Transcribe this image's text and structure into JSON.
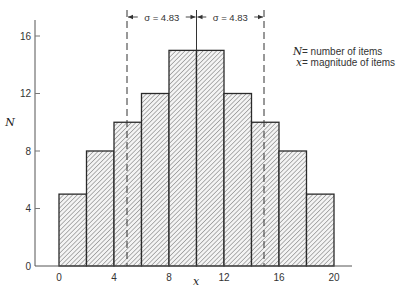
{
  "chart_data": {
    "type": "bar",
    "subtype": "histogram",
    "title": "",
    "xlabel": "x",
    "ylabel": "N",
    "bins": [
      [
        0,
        2
      ],
      [
        2,
        4
      ],
      [
        4,
        6
      ],
      [
        6,
        8
      ],
      [
        8,
        10
      ],
      [
        10,
        12
      ],
      [
        12,
        14
      ],
      [
        14,
        16
      ],
      [
        16,
        18
      ],
      [
        18,
        20
      ]
    ],
    "categories": [
      "0-2",
      "2-4",
      "4-6",
      "6-8",
      "8-10",
      "10-12",
      "12-14",
      "14-16",
      "16-18",
      "18-20"
    ],
    "values": [
      5,
      8,
      10,
      12,
      15,
      15,
      12,
      10,
      8,
      5
    ],
    "xlim": [
      0,
      20
    ],
    "ylim": [
      0,
      17
    ],
    "xticks": [
      0,
      4,
      8,
      12,
      16,
      20
    ],
    "yticks": [
      0,
      4,
      8,
      12,
      16
    ],
    "grid": false,
    "fill_pattern": "diagonal-hatch",
    "mean": 10,
    "sigma": 4.83,
    "annotations": {
      "sigma_left": "σ = 4.83",
      "sigma_right": "σ = 4.83",
      "dashed_lines_at": [
        5.17,
        14.83
      ],
      "solid_line_at": 10
    },
    "legend": [
      {
        "symbol": "N",
        "text": "= number of items"
      },
      {
        "symbol": "x",
        "text": "= magnitude of items"
      }
    ],
    "legend_position": "upper right"
  }
}
